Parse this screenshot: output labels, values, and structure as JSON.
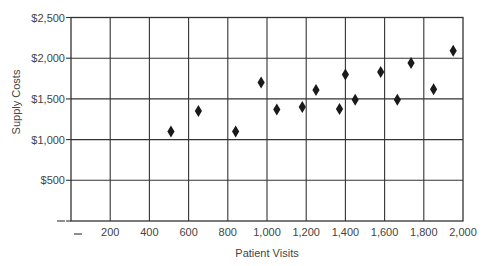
{
  "chart_data": {
    "type": "scatter",
    "title": "",
    "xlabel": "Patient Visits",
    "ylabel": "Supply Costs",
    "xlim": [
      0,
      2000
    ],
    "ylim": [
      0,
      2500
    ],
    "grid": true,
    "legend": null,
    "marker": "diamond",
    "x_ticks": [
      0,
      200,
      400,
      600,
      800,
      1000,
      1200,
      1400,
      1600,
      1800,
      2000
    ],
    "x_tick_labels": [
      "—",
      "200",
      "400",
      "600",
      "800",
      "1,000",
      "1,200",
      "1,400",
      "1,600",
      "1,800",
      "2,000"
    ],
    "y_ticks": [
      0,
      500,
      1000,
      1500,
      2000,
      2500
    ],
    "y_tick_labels": [
      "—",
      "$500",
      "$1,000",
      "$1,500",
      "$2,000",
      "$2,500"
    ],
    "series": [
      {
        "name": "Supply Costs vs Patient Visits",
        "points": [
          {
            "x": 510,
            "y": 1100
          },
          {
            "x": 650,
            "y": 1350
          },
          {
            "x": 840,
            "y": 1100
          },
          {
            "x": 970,
            "y": 1700
          },
          {
            "x": 1050,
            "y": 1370
          },
          {
            "x": 1180,
            "y": 1400
          },
          {
            "x": 1250,
            "y": 1610
          },
          {
            "x": 1370,
            "y": 1375
          },
          {
            "x": 1400,
            "y": 1800
          },
          {
            "x": 1450,
            "y": 1490
          },
          {
            "x": 1580,
            "y": 1830
          },
          {
            "x": 1665,
            "y": 1490
          },
          {
            "x": 1735,
            "y": 1940
          },
          {
            "x": 1850,
            "y": 1620
          },
          {
            "x": 1950,
            "y": 2090
          }
        ]
      }
    ]
  },
  "colors": {
    "grid": "#333333",
    "marker": "#1a1a1a",
    "text": "#444444",
    "background": "#ffffff"
  }
}
